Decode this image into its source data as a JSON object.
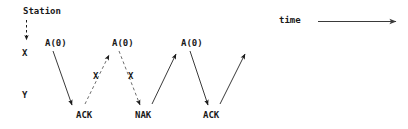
{
  "diagram": {
    "title_label": "Station",
    "time_label": "time",
    "stations": {
      "upper": "X",
      "lower": "Y"
    },
    "messages": [
      {
        "id": "a0-1",
        "label": "A(0)",
        "direction": "down",
        "style": "solid",
        "lost": false
      },
      {
        "id": "ack-1",
        "label": "ACK",
        "direction": "up",
        "style": "dashed",
        "lost": true
      },
      {
        "id": "a0-2",
        "label": "A(0)",
        "direction": "down",
        "style": "dashed",
        "lost": true
      },
      {
        "id": "nak-1",
        "label": "NAK",
        "direction": "up",
        "style": "solid",
        "lost": false
      },
      {
        "id": "a0-3",
        "label": "A(0)",
        "direction": "down",
        "style": "solid",
        "lost": false
      },
      {
        "id": "ack-2",
        "label": "ACK",
        "direction": "up",
        "style": "solid",
        "lost": false
      }
    ],
    "loss_markers": [
      {
        "id": "loss-1",
        "label": "X"
      },
      {
        "id": "loss-2",
        "label": "X"
      }
    ],
    "labels": {
      "a0_first": "A(0)",
      "a0_second": "A(0)",
      "a0_third": "A(0)",
      "ack_first": "ACK",
      "nak_first": "NAK",
      "ack_second": "ACK",
      "loss_first": "X",
      "loss_second": "X"
    },
    "colors": {
      "ink": "#1a1a1a",
      "line": "#3a3a3a",
      "background": "#ffffff"
    }
  }
}
